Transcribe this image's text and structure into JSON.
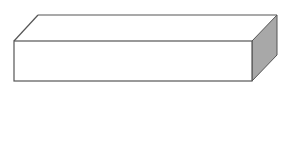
{
  "boxes": [
    {
      "label": "1"
    },
    {
      "label": "2"
    },
    {
      "label": "3"
    },
    {
      "label": "4"
    },
    {
      "label": "5"
    },
    {
      "label": "6"
    }
  ],
  "balls_row1": [
    {
      "label": "A"
    },
    {
      "label": "B"
    },
    {
      "label": "D"
    }
  ],
  "balls_row2": [
    {
      "label": "B"
    },
    {
      "label": "C"
    },
    {
      "label": "D"
    }
  ],
  "colors": {
    "outline": "#555555",
    "inner_dark": "#8a8a8a",
    "inner_light": "#b8b8b8",
    "side": "#a8a8a8",
    "ball": "#9a9a9a"
  }
}
